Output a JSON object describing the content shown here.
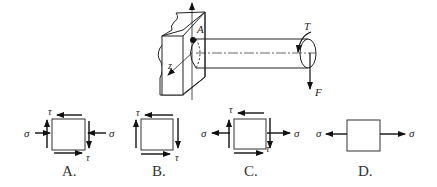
{
  "figure": {
    "shaft": {
      "point_label": "A",
      "axis_label": "z",
      "torque_label": "T",
      "force_label": "F"
    },
    "options": [
      {
        "label": "A.",
        "stress_labels": {
          "sigma_left": "σ",
          "sigma_right": "σ",
          "tau_top": "τ",
          "tau_bottom": "τ"
        },
        "sigma_direction": "compressive"
      },
      {
        "label": "B.",
        "stress_labels": {
          "tau_top": "τ",
          "tau_bottom": "τ"
        }
      },
      {
        "label": "C.",
        "stress_labels": {
          "sigma_left": "σ",
          "sigma_right": "σ",
          "tau_top": "τ",
          "tau_bottom": "τ"
        },
        "sigma_direction": "tensile"
      },
      {
        "label": "D.",
        "stress_labels": {
          "sigma_left": "σ",
          "sigma_right": "σ"
        },
        "sigma_direction": "tensile"
      }
    ]
  }
}
